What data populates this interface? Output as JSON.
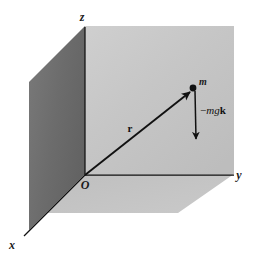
{
  "figure": {
    "type": "physics-vector-diagram",
    "canvas": {
      "width": 261,
      "height": 262,
      "background": "#ffffff"
    },
    "colors": {
      "background": "#ffffff",
      "wall_dark": "#6e6e6e",
      "wall_light": "#c6c6c6",
      "floor": "#c2c2c2",
      "line": "#111111",
      "text": "#1a1a1a"
    },
    "axes": [
      {
        "name": "z-axis",
        "label": "z",
        "label_x": 82,
        "label_y": 21,
        "direction": "up"
      },
      {
        "name": "y-axis",
        "label": "y",
        "label_x": 239,
        "label_y": 177,
        "direction": "right"
      },
      {
        "name": "x-axis",
        "label": "x",
        "label_x": 11,
        "label_y": 248,
        "direction": "down-left"
      }
    ],
    "origin": {
      "name": "origin",
      "label": "O",
      "label_x": 84,
      "label_y": 187,
      "point_x": 85,
      "point_y": 175
    },
    "mass": {
      "label": "m",
      "label_x": 200,
      "label_y": 84,
      "point_x": 193,
      "point_y": 88,
      "radius": 3.4
    },
    "position_vector": {
      "name": "position-vector-r",
      "label": "r",
      "label_x": 130,
      "label_y": 131,
      "from_x": 85,
      "from_y": 175,
      "to_x": 191,
      "to_y": 91
    },
    "force_vector": {
      "name": "weight-force-vector",
      "label_full": "−mgk",
      "label_minus": "−",
      "label_mg": "mg",
      "label_k": "k",
      "label_x": 203,
      "label_y": 113,
      "from_x": 195,
      "from_y": 90,
      "to_x": 196,
      "to_y": 144
    },
    "planes": [
      {
        "name": "xz-wall-plane",
        "shade": "dark",
        "points": "29,230 85,174 85,26 29,82"
      },
      {
        "name": "yz-wall-plane",
        "shade": "light",
        "points": "85,26 234,26 234,174 85,174"
      },
      {
        "name": "xy-floor-plane",
        "shade": "floor",
        "points": "85,174 234,174 178,213 29,213 29,230"
      }
    ]
  }
}
